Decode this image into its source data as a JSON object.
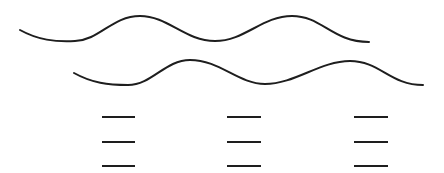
{
  "diagram": {
    "colors": {
      "background": "#ffffff",
      "stroke": "#1e1e1e"
    },
    "waves": [
      {
        "name": "top-wave",
        "path": "M20 30 C 38 40, 55 42, 75 41 C 100 40, 112 16, 140 16 C 168 16, 185 41, 215 41 C 245 41, 262 16, 292 16 C 322 16, 332 42, 369 42"
      },
      {
        "name": "bottom-wave",
        "path": "M74 73 C 92 83, 108 85, 128 85 C 152 85, 165 60, 190 60 C 220 60, 238 84, 265 84 C 295 84, 320 61, 350 61 C 380 61, 390 85, 423 85"
      }
    ],
    "dash_columns": [
      {
        "x1": 102,
        "x2": 135,
        "ys": [
          117,
          142,
          166
        ]
      },
      {
        "x1": 227,
        "x2": 261,
        "ys": [
          117,
          142,
          166
        ]
      },
      {
        "x1": 354,
        "x2": 388,
        "ys": [
          117,
          142,
          166
        ]
      }
    ]
  }
}
